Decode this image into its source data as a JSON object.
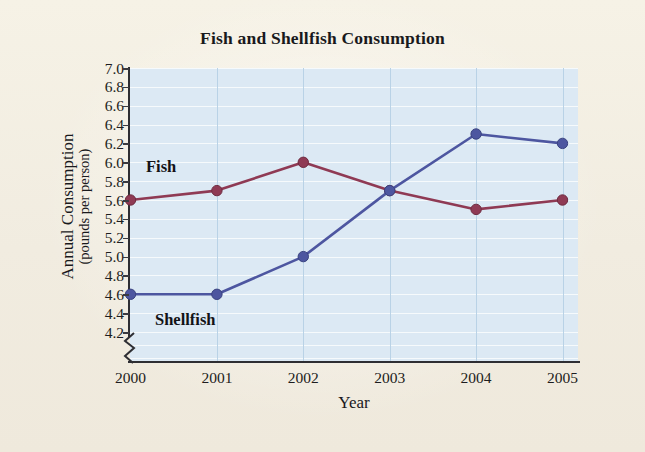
{
  "chart_data": {
    "type": "line",
    "title": "Fish and Shellfish Consumption",
    "xlabel": "Year",
    "ylabel_main": "Annual Consumption",
    "ylabel_sub": "(pounds per person)",
    "categories": [
      "2000",
      "2001",
      "2002",
      "2003",
      "2004",
      "2005"
    ],
    "x_tick_labels": [
      "2000",
      "2001",
      "2002",
      "2003",
      "2004",
      "2005"
    ],
    "y_tick_labels": [
      "7.0",
      "6.8",
      "6.6",
      "6.4",
      "6.2",
      "6.0",
      "5.8",
      "5.6",
      "5.4",
      "5.2",
      "5.0",
      "4.8",
      "4.6",
      "4.4",
      "4.2"
    ],
    "y_tick_values": [
      7.0,
      6.8,
      6.6,
      6.4,
      6.2,
      6.0,
      5.8,
      5.6,
      5.4,
      5.2,
      5.0,
      4.8,
      4.6,
      4.4,
      4.2
    ],
    "ylim": [
      4.2,
      7.0
    ],
    "y_axis_break": true,
    "grid": "horizontal-and-vertical",
    "legend": "inline-labels",
    "plot_background": "#dce9f4",
    "figure_background": "#f2eee1",
    "series": [
      {
        "name": "Fish",
        "color": "#8f3a54",
        "values": [
          5.6,
          5.7,
          6.0,
          5.7,
          5.5,
          5.6
        ],
        "label_text": "Fish"
      },
      {
        "name": "Shellfish",
        "color": "#4d56a0",
        "values": [
          4.6,
          4.6,
          5.0,
          5.7,
          6.3,
          6.2
        ],
        "label_text": "Shellfish"
      }
    ]
  }
}
